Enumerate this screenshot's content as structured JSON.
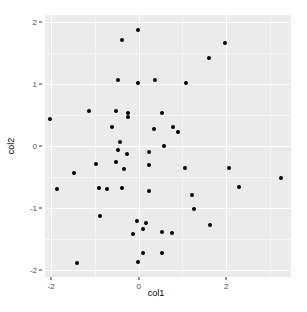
{
  "chart_data": {
    "type": "scatter",
    "title": "",
    "xlabel": "col1",
    "ylabel": "col2",
    "xlim": [
      -2.14,
      3.48
    ],
    "ylim": [
      -2.11,
      2.11
    ],
    "xticks": [
      -2,
      0,
      2
    ],
    "xtick_labels": [
      "-2",
      "0",
      "2"
    ],
    "yticks": [
      -2,
      -1,
      0,
      1,
      2
    ],
    "ytick_labels": [
      "-2",
      "-1",
      "0",
      "1",
      "2"
    ],
    "x_minor_ticks": [
      -1,
      1,
      3
    ],
    "y_minor_ticks": [
      -1.5,
      -0.5,
      0.5,
      1.5
    ],
    "grid": true,
    "legend": false,
    "panel_background": "#ebebeb",
    "grid_major_color": "#ffffff",
    "grid_minor_color": "#f5f5f5",
    "point_color": "#000000",
    "point_size": 4,
    "n_points": 50,
    "points": [
      {
        "x": -0.01,
        "y": 1.87
      },
      {
        "x": -0.39,
        "y": 1.7
      },
      {
        "x": 1.98,
        "y": 1.66
      },
      {
        "x": 1.61,
        "y": 1.41
      },
      {
        "x": -0.47,
        "y": 1.06
      },
      {
        "x": -0.02,
        "y": 1.01
      },
      {
        "x": 0.37,
        "y": 1.06
      },
      {
        "x": 1.07,
        "y": 1.01
      },
      {
        "x": -2.03,
        "y": 0.43
      },
      {
        "x": -1.14,
        "y": 0.56
      },
      {
        "x": -0.51,
        "y": 0.56
      },
      {
        "x": -0.24,
        "y": 0.53
      },
      {
        "x": -0.24,
        "y": 0.47
      },
      {
        "x": 0.53,
        "y": 0.53
      },
      {
        "x": -0.61,
        "y": 0.31
      },
      {
        "x": 0.34,
        "y": 0.27
      },
      {
        "x": 0.78,
        "y": 0.31
      },
      {
        "x": 0.9,
        "y": 0.22
      },
      {
        "x": -0.43,
        "y": 0.06
      },
      {
        "x": 0.59,
        "y": 0.0
      },
      {
        "x": -0.48,
        "y": -0.06
      },
      {
        "x": -0.27,
        "y": -0.13
      },
      {
        "x": 0.24,
        "y": -0.1
      },
      {
        "x": -0.97,
        "y": -0.29
      },
      {
        "x": -0.52,
        "y": -0.26
      },
      {
        "x": -0.34,
        "y": -0.37
      },
      {
        "x": 0.24,
        "y": -0.31
      },
      {
        "x": 1.06,
        "y": -0.35
      },
      {
        "x": 2.06,
        "y": -0.35
      },
      {
        "x": 3.26,
        "y": -0.51
      },
      {
        "x": -1.48,
        "y": -0.43
      },
      {
        "x": -1.87,
        "y": -0.7
      },
      {
        "x": -0.91,
        "y": -0.68
      },
      {
        "x": -0.73,
        "y": -0.7
      },
      {
        "x": -0.39,
        "y": -0.68
      },
      {
        "x": 0.24,
        "y": -0.72
      },
      {
        "x": 1.21,
        "y": -0.79
      },
      {
        "x": 2.29,
        "y": -0.66
      },
      {
        "x": 1.26,
        "y": -1.01
      },
      {
        "x": -0.88,
        "y": -1.13
      },
      {
        "x": -0.04,
        "y": -1.21
      },
      {
        "x": 0.16,
        "y": -1.24
      },
      {
        "x": 1.63,
        "y": -1.27
      },
      {
        "x": 0.53,
        "y": -1.39
      },
      {
        "x": 0.77,
        "y": -1.4
      },
      {
        "x": -0.13,
        "y": -1.42
      },
      {
        "x": 0.1,
        "y": -1.34
      },
      {
        "x": 0.53,
        "y": -1.72
      },
      {
        "x": 0.1,
        "y": -1.72
      },
      {
        "x": -0.01,
        "y": -1.87
      },
      {
        "x": -1.41,
        "y": -1.89
      }
    ]
  },
  "axis": {
    "x_title": "col1",
    "y_title": "col2"
  }
}
